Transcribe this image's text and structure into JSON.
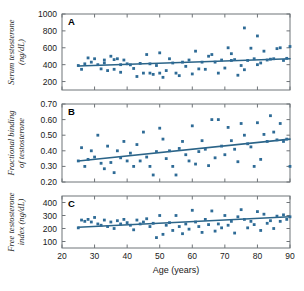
{
  "figure": {
    "name": "testosterone-vs-age-three-panel-scatter",
    "background": "#ffffff",
    "marker_color": "#2e6b96",
    "line_color": "#2b6488",
    "axis_color": "#6f7478"
  },
  "shared_axis": {
    "xlabel": "Age (years)",
    "xlim": [
      20,
      90
    ],
    "xticks": [
      20,
      30,
      40,
      50,
      60,
      70,
      80,
      90
    ],
    "xticklabels": [
      "20",
      "30",
      "40",
      "50",
      "60",
      "70",
      "80",
      "90"
    ]
  },
  "chart_data": [
    {
      "type": "scatter",
      "panel": "A",
      "title": "",
      "xlabel": "Age (years)",
      "ylabel": "Serum testosterone (ng/dL)",
      "ylabel_line1": "Serum testosterone",
      "ylabel_line2": "(ng/dL)",
      "xlim": [
        20,
        90
      ],
      "ylim": [
        100,
        1000
      ],
      "yticks": [
        200,
        400,
        600,
        800,
        1000
      ],
      "yticklabels": [
        "200",
        "400",
        "600",
        "800",
        "1000"
      ],
      "grid": false,
      "legend": "none",
      "fit_line": {
        "x": [
          25,
          90
        ],
        "y": [
          385,
          470
        ]
      },
      "points": [
        [
          25,
          390
        ],
        [
          26,
          345
        ],
        [
          27,
          410
        ],
        [
          28,
          480
        ],
        [
          29,
          430
        ],
        [
          30,
          470
        ],
        [
          31,
          400
        ],
        [
          32,
          350
        ],
        [
          33,
          420
        ],
        [
          33,
          455
        ],
        [
          34,
          330
        ],
        [
          35,
          500
        ],
        [
          36,
          460
        ],
        [
          36,
          345
        ],
        [
          37,
          470
        ],
        [
          38,
          400
        ],
        [
          38,
          310
        ],
        [
          39,
          455
        ],
        [
          40,
          410
        ],
        [
          41,
          398
        ],
        [
          42,
          355
        ],
        [
          43,
          260
        ],
        [
          44,
          415
        ],
        [
          45,
          300
        ],
        [
          46,
          520
        ],
        [
          47,
          300
        ],
        [
          47,
          410
        ],
        [
          48,
          285
        ],
        [
          49,
          390
        ],
        [
          50,
          540
        ],
        [
          50,
          300
        ],
        [
          51,
          250
        ],
        [
          52,
          330
        ],
        [
          53,
          470
        ],
        [
          54,
          420
        ],
        [
          55,
          300
        ],
        [
          56,
          270
        ],
        [
          57,
          430
        ],
        [
          58,
          380
        ],
        [
          59,
          455
        ],
        [
          60,
          290
        ],
        [
          61,
          560
        ],
        [
          62,
          350
        ],
        [
          63,
          430
        ],
        [
          64,
          345
        ],
        [
          65,
          500
        ],
        [
          66,
          520
        ],
        [
          67,
          430
        ],
        [
          68,
          300
        ],
        [
          69,
          455
        ],
        [
          70,
          360
        ],
        [
          71,
          600
        ],
        [
          72,
          530
        ],
        [
          72,
          450
        ],
        [
          73,
          460
        ],
        [
          74,
          275
        ],
        [
          75,
          390
        ],
        [
          76,
          835
        ],
        [
          76,
          340
        ],
        [
          77,
          450
        ],
        [
          78,
          595
        ],
        [
          79,
          470
        ],
        [
          80,
          400
        ],
        [
          80,
          740
        ],
        [
          81,
          420
        ],
        [
          82,
          560
        ],
        [
          83,
          455
        ],
        [
          84,
          465
        ],
        [
          85,
          470
        ],
        [
          86,
          590
        ],
        [
          87,
          600
        ],
        [
          88,
          450
        ],
        [
          89,
          475
        ],
        [
          90,
          615
        ]
      ]
    },
    {
      "type": "scatter",
      "panel": "B",
      "title": "",
      "xlabel": "Age (years)",
      "ylabel": "Fractional binding of testosterone",
      "ylabel_line1": "Fractional binding",
      "ylabel_line2": "of testosterone",
      "xlim": [
        20,
        90
      ],
      "ylim": [
        0.2,
        0.7
      ],
      "yticks": [
        0.2,
        0.3,
        0.4,
        0.5,
        0.6,
        0.7
      ],
      "yticklabels": [
        "0.20",
        "0.30",
        "0.40",
        "0.50",
        "0.60",
        "0.70"
      ],
      "grid": false,
      "legend": "none",
      "fit_line": {
        "x": [
          25,
          90
        ],
        "y": [
          0.335,
          0.475
        ]
      },
      "points": [
        [
          25,
          0.335
        ],
        [
          26,
          0.42
        ],
        [
          27,
          0.3
        ],
        [
          28,
          0.345
        ],
        [
          29,
          0.4
        ],
        [
          30,
          0.36
        ],
        [
          31,
          0.5
        ],
        [
          32,
          0.32
        ],
        [
          33,
          0.285
        ],
        [
          34,
          0.43
        ],
        [
          35,
          0.325
        ],
        [
          36,
          0.26
        ],
        [
          37,
          0.4
        ],
        [
          38,
          0.355
        ],
        [
          39,
          0.46
        ],
        [
          40,
          0.335
        ],
        [
          41,
          0.385
        ],
        [
          42,
          0.3
        ],
        [
          43,
          0.44
        ],
        [
          44,
          0.335
        ],
        [
          45,
          0.52
        ],
        [
          46,
          0.36
        ],
        [
          47,
          0.3
        ],
        [
          48,
          0.245
        ],
        [
          49,
          0.395
        ],
        [
          50,
          0.545
        ],
        [
          51,
          0.475
        ],
        [
          52,
          0.35
        ],
        [
          53,
          0.4
        ],
        [
          54,
          0.3
        ],
        [
          55,
          0.245
        ],
        [
          56,
          0.415
        ],
        [
          57,
          0.46
        ],
        [
          58,
          0.375
        ],
        [
          59,
          0.335
        ],
        [
          60,
          0.56
        ],
        [
          61,
          0.315
        ],
        [
          62,
          0.395
        ],
        [
          63,
          0.465
        ],
        [
          64,
          0.41
        ],
        [
          65,
          0.305
        ],
        [
          66,
          0.6
        ],
        [
          67,
          0.355
        ],
        [
          68,
          0.6
        ],
        [
          69,
          0.43
        ],
        [
          70,
          0.375
        ],
        [
          71,
          0.55
        ],
        [
          72,
          0.465
        ],
        [
          73,
          0.41
        ],
        [
          74,
          0.33
        ],
        [
          75,
          0.575
        ],
        [
          76,
          0.5
        ],
        [
          77,
          0.445
        ],
        [
          78,
          0.425
        ],
        [
          79,
          0.3
        ],
        [
          80,
          0.58
        ],
        [
          81,
          0.345
        ],
        [
          82,
          0.505
        ],
        [
          83,
          0.46
        ],
        [
          84,
          0.625
        ],
        [
          85,
          0.52
        ],
        [
          86,
          0.47
        ],
        [
          87,
          0.575
        ],
        [
          88,
          0.46
        ],
        [
          89,
          0.475
        ],
        [
          90,
          0.3
        ]
      ]
    },
    {
      "type": "scatter",
      "panel": "C",
      "title": "",
      "xlabel": "Age (years)",
      "ylabel": "Free testosterone index (ng/dL)",
      "ylabel_line1": "Free testosterone",
      "ylabel_line2": "index (ng/dL)",
      "xlim": [
        20,
        90
      ],
      "ylim": [
        50,
        450
      ],
      "yticks": [
        100,
        200,
        300,
        400
      ],
      "yticklabels": [
        "100",
        "200",
        "300",
        "400"
      ],
      "grid": false,
      "legend": "none",
      "fit_line": {
        "x": [
          25,
          90
        ],
        "y": [
          210,
          290
        ]
      },
      "points": [
        [
          25,
          205
        ],
        [
          26,
          265
        ],
        [
          27,
          255
        ],
        [
          28,
          270
        ],
        [
          29,
          250
        ],
        [
          30,
          285
        ],
        [
          31,
          235
        ],
        [
          32,
          225
        ],
        [
          33,
          265
        ],
        [
          34,
          215
        ],
        [
          35,
          250
        ],
        [
          36,
          200
        ],
        [
          37,
          260
        ],
        [
          38,
          235
        ],
        [
          39,
          270
        ],
        [
          40,
          245
        ],
        [
          41,
          225
        ],
        [
          42,
          190
        ],
        [
          43,
          265
        ],
        [
          44,
          235
        ],
        [
          45,
          250
        ],
        [
          46,
          275
        ],
        [
          47,
          215
        ],
        [
          48,
          240
        ],
        [
          49,
          130
        ],
        [
          50,
          300
        ],
        [
          51,
          155
        ],
        [
          52,
          225
        ],
        [
          53,
          245
        ],
        [
          54,
          185
        ],
        [
          55,
          300
        ],
        [
          56,
          215
        ],
        [
          57,
          160
        ],
        [
          58,
          235
        ],
        [
          59,
          195
        ],
        [
          60,
          340
        ],
        [
          61,
          250
        ],
        [
          62,
          215
        ],
        [
          63,
          170
        ],
        [
          64,
          270
        ],
        [
          65,
          230
        ],
        [
          66,
          335
        ],
        [
          67,
          180
        ],
        [
          68,
          235
        ],
        [
          69,
          205
        ],
        [
          70,
          300
        ],
        [
          71,
          225
        ],
        [
          72,
          255
        ],
        [
          73,
          165
        ],
        [
          74,
          290
        ],
        [
          75,
          345
        ],
        [
          76,
          270
        ],
        [
          77,
          205
        ],
        [
          78,
          255
        ],
        [
          79,
          230
        ],
        [
          80,
          330
        ],
        [
          81,
          185
        ],
        [
          82,
          310
        ],
        [
          83,
          240
        ],
        [
          84,
          260
        ],
        [
          85,
          200
        ],
        [
          86,
          295
        ],
        [
          87,
          255
        ],
        [
          88,
          305
        ],
        [
          89,
          270
        ],
        [
          90,
          290
        ]
      ]
    }
  ]
}
